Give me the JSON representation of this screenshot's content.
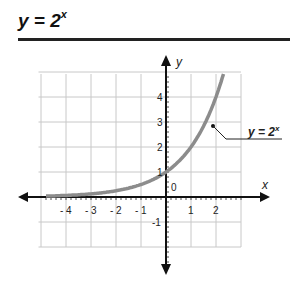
{
  "header": {
    "title_base": "y = 2",
    "title_exp": "x"
  },
  "chart_data": {
    "type": "line",
    "xlabel": "x",
    "ylabel": "y",
    "xlim": [
      -5,
      3
    ],
    "ylim": [
      -2,
      5
    ],
    "grid": true,
    "x_ticks": [
      "-4",
      "-3",
      "-2",
      "-1",
      "1",
      "2"
    ],
    "y_ticks": [
      "4",
      "3",
      "2",
      "1",
      "-1"
    ],
    "origin_label": "0",
    "series": [
      {
        "name": "y = 2^x",
        "color": "#8a8a8a",
        "x": [
          -4.8,
          -4,
          -3,
          -2,
          -1,
          0,
          0.5,
          1,
          1.5,
          2,
          2.3
        ],
        "y": [
          0.036,
          0.0625,
          0.125,
          0.25,
          0.5,
          1,
          1.414,
          2,
          2.828,
          4,
          4.92
        ]
      }
    ],
    "annotations": [
      {
        "text_base": "y = 2",
        "text_exp": "x",
        "point": [
          1.5,
          2.828
        ]
      }
    ]
  }
}
